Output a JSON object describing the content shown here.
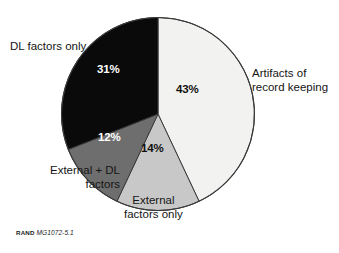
{
  "chart_data": {
    "type": "pie",
    "title": "",
    "xlabel": "",
    "ylabel": "",
    "legend_position": "none",
    "grid": false,
    "start_angle_deg": 0,
    "direction": "clockwise",
    "unit": "%",
    "categories": [
      "Artifacts of record keeping",
      "External factors only",
      "External + DL factors",
      "DL factors only"
    ],
    "values": [
      43,
      14,
      12,
      31
    ],
    "slices": [
      {
        "key": "artifacts",
        "label_line1": "Artifacts of",
        "label_line2": "record keeping",
        "value": 43,
        "value_text": "43%",
        "color": "#f2f2f0",
        "label_color": "#111111"
      },
      {
        "key": "external",
        "label_line1": "External",
        "label_line2": "factors only",
        "value": 14,
        "value_text": "14%",
        "color": "#c8c8c8",
        "label_color": "#111111"
      },
      {
        "key": "external-dl",
        "label_line1": "External + DL",
        "label_line2": "factors",
        "value": 12,
        "value_text": "12%",
        "color": "#6e6e6e",
        "label_color": "#ffffff"
      },
      {
        "key": "dl",
        "label_line1": "DL factors only",
        "label_line2": "",
        "value": 31,
        "value_text": "31%",
        "color": "#0a0a0a",
        "label_color": "#ffffff"
      }
    ]
  },
  "source": {
    "org": "RAND",
    "id": "MG1072-5.1"
  },
  "colors": {
    "background": "#ffffff",
    "outline": "#3a3a3a",
    "text": "#151515"
  }
}
